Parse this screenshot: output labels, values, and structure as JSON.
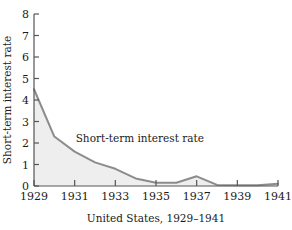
{
  "chart_data": {
    "type": "area",
    "title": "",
    "subtitle": "",
    "caption": "United States, 1929–1941",
    "xlabel": "United States, 1929–1941",
    "ylabel": "Short-term interest rate",
    "series_label": "Short-term interest rate",
    "x": [
      1929,
      1930,
      1931,
      1932,
      1933,
      1934,
      1935,
      1936,
      1937,
      1938,
      1939,
      1940,
      1941
    ],
    "values": [
      4.5,
      2.3,
      1.6,
      1.1,
      0.8,
      0.35,
      0.15,
      0.15,
      0.45,
      0.05,
      0.03,
      0.03,
      0.1
    ],
    "series": [
      {
        "name": "Short-term interest rate",
        "values": [
          4.5,
          2.3,
          1.6,
          1.1,
          0.8,
          0.35,
          0.15,
          0.15,
          0.45,
          0.05,
          0.03,
          0.03,
          0.1
        ]
      }
    ],
    "xlim": [
      1929,
      1941
    ],
    "ylim": [
      0,
      8
    ],
    "xticks": [
      1929,
      1931,
      1933,
      1935,
      1937,
      1939,
      1941
    ],
    "xtick_labels": [
      "1929",
      "1931",
      "1933",
      "1935",
      "1937",
      "1939",
      "1941"
    ],
    "yticks": [
      0,
      1,
      2,
      3,
      4,
      5,
      6,
      7,
      8
    ],
    "ytick_labels": [
      "0",
      "1",
      "2",
      "3",
      "4",
      "5",
      "6",
      "7",
      "8"
    ],
    "grid": false,
    "legend": "none",
    "annotations": [
      {
        "text": "Short-term interest rate",
        "x": 1931.05,
        "y": 2.05
      }
    ],
    "colors": {
      "line": "#8c8c8c",
      "fill": "#eeeeee",
      "axis": "#555555",
      "text": "#1a1a1a",
      "background": "#ffffff"
    }
  }
}
